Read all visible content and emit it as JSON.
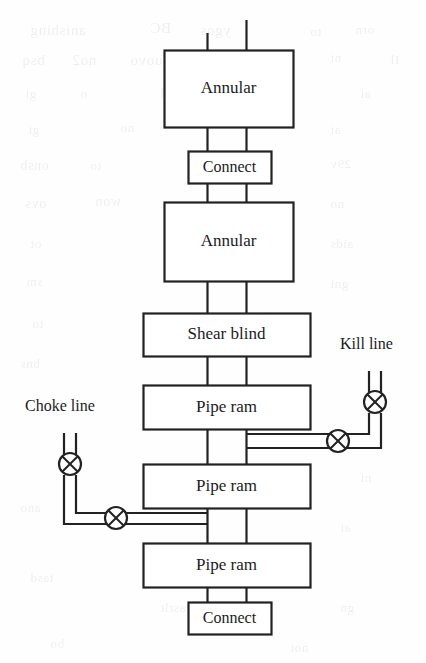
{
  "diagram": {
    "colors": {
      "stroke": "#222222",
      "text": "#1b1b1b",
      "background": "#fefefe"
    },
    "stack": [
      {
        "id": "annular-top",
        "label": "Annular",
        "x": 164,
        "y": 50,
        "w": 129,
        "h": 77,
        "font": 17
      },
      {
        "id": "connect-top",
        "label": "Connect",
        "x": 188,
        "y": 151,
        "w": 83,
        "h": 32,
        "font": 16
      },
      {
        "id": "annular-lower",
        "label": "Annular",
        "x": 164,
        "y": 202,
        "w": 129,
        "h": 79,
        "font": 17
      },
      {
        "id": "shear-blind",
        "label": "Shear blind",
        "x": 143,
        "y": 313,
        "w": 167,
        "h": 43,
        "font": 17
      },
      {
        "id": "pipe-ram-1",
        "label": "Pipe ram",
        "x": 143,
        "y": 385,
        "w": 167,
        "h": 44,
        "font": 17
      },
      {
        "id": "pipe-ram-2",
        "label": "Pipe ram",
        "x": 143,
        "y": 464,
        "w": 167,
        "h": 44,
        "font": 17
      },
      {
        "id": "pipe-ram-3",
        "label": "Pipe ram",
        "x": 143,
        "y": 543,
        "w": 167,
        "h": 44,
        "font": 17
      },
      {
        "id": "connect-bottom",
        "label": "Connect",
        "x": 188,
        "y": 602,
        "w": 83,
        "h": 32,
        "font": 16
      }
    ],
    "side_lines": [
      {
        "id": "kill-line",
        "label": "Kill line",
        "label_x": 340,
        "label_y": 345,
        "font": 16
      },
      {
        "id": "choke-line",
        "label": "Choke line",
        "label_x": 25,
        "label_y": 407,
        "font": 16
      }
    ],
    "valves": [
      {
        "id": "kill-valve-vertical",
        "cx": 375,
        "cy": 402,
        "r": 11
      },
      {
        "id": "kill-valve-horizontal",
        "cx": 338,
        "cy": 441,
        "r": 11
      },
      {
        "id": "choke-valve-vertical",
        "cx": 70,
        "cy": 464,
        "r": 11
      },
      {
        "id": "choke-valve-horizontal",
        "cx": 116,
        "cy": 518,
        "r": 11
      }
    ],
    "icons": {
      "valve": "valve-cross-circle-icon"
    }
  },
  "bleed_through": [
    {
      "text": "anishing",
      "x": 30,
      "y": 22,
      "size": 15
    },
    {
      "text": "BC",
      "x": 150,
      "y": 20,
      "size": 15
    },
    {
      "text": "ygos",
      "x": 200,
      "y": 22,
      "size": 15
    },
    {
      "text": "to",
      "x": 310,
      "y": 24,
      "size": 13
    },
    {
      "text": "orn",
      "x": 355,
      "y": 22,
      "size": 13
    },
    {
      "text": "bsq",
      "x": 22,
      "y": 52,
      "size": 15
    },
    {
      "text": "no2",
      "x": 72,
      "y": 52,
      "size": 15
    },
    {
      "text": "bouovo",
      "x": 130,
      "y": 52,
      "size": 15
    },
    {
      "text": "ni",
      "x": 330,
      "y": 50,
      "size": 13
    },
    {
      "text": "Il",
      "x": 390,
      "y": 52,
      "size": 13
    },
    {
      "text": "gi",
      "x": 25,
      "y": 86,
      "size": 13
    },
    {
      "text": "o",
      "x": 80,
      "y": 86,
      "size": 13
    },
    {
      "text": "giboold",
      "x": 160,
      "y": 86,
      "size": 14
    },
    {
      "text": "ai",
      "x": 360,
      "y": 86,
      "size": 13
    },
    {
      "text": "gi",
      "x": 28,
      "y": 122,
      "size": 13
    },
    {
      "text": "no",
      "x": 120,
      "y": 120,
      "size": 13
    },
    {
      "text": "ai",
      "x": 330,
      "y": 122,
      "size": 13
    },
    {
      "text": "onsb",
      "x": 20,
      "y": 158,
      "size": 14
    },
    {
      "text": "to",
      "x": 90,
      "y": 158,
      "size": 13
    },
    {
      "text": "29v",
      "x": 330,
      "y": 156,
      "size": 13
    },
    {
      "text": "ovs",
      "x": 25,
      "y": 196,
      "size": 14
    },
    {
      "text": "won",
      "x": 95,
      "y": 194,
      "size": 14
    },
    {
      "text": "no",
      "x": 330,
      "y": 196,
      "size": 13
    },
    {
      "text": "ot",
      "x": 30,
      "y": 236,
      "size": 13
    },
    {
      "text": "aids",
      "x": 330,
      "y": 236,
      "size": 13
    },
    {
      "text": "sm",
      "x": 26,
      "y": 274,
      "size": 13
    },
    {
      "text": "gni",
      "x": 330,
      "y": 276,
      "size": 13
    },
    {
      "text": "to",
      "x": 32,
      "y": 316,
      "size": 13
    },
    {
      "text": "bns",
      "x": 20,
      "y": 356,
      "size": 13
    },
    {
      "text": "ni",
      "x": 360,
      "y": 470,
      "size": 13
    },
    {
      "text": "ano",
      "x": 20,
      "y": 500,
      "size": 13
    },
    {
      "text": "bnu",
      "x": 210,
      "y": 540,
      "size": 13
    },
    {
      "text": "ai",
      "x": 340,
      "y": 520,
      "size": 13
    },
    {
      "text": "tasd",
      "x": 30,
      "y": 570,
      "size": 13
    },
    {
      "text": "asrlt",
      "x": 160,
      "y": 600,
      "size": 13
    },
    {
      "text": "gn",
      "x": 340,
      "y": 600,
      "size": 13
    },
    {
      "text": "bo",
      "x": 50,
      "y": 636,
      "size": 13
    },
    {
      "text": "not",
      "x": 290,
      "y": 640,
      "size": 13
    }
  ]
}
